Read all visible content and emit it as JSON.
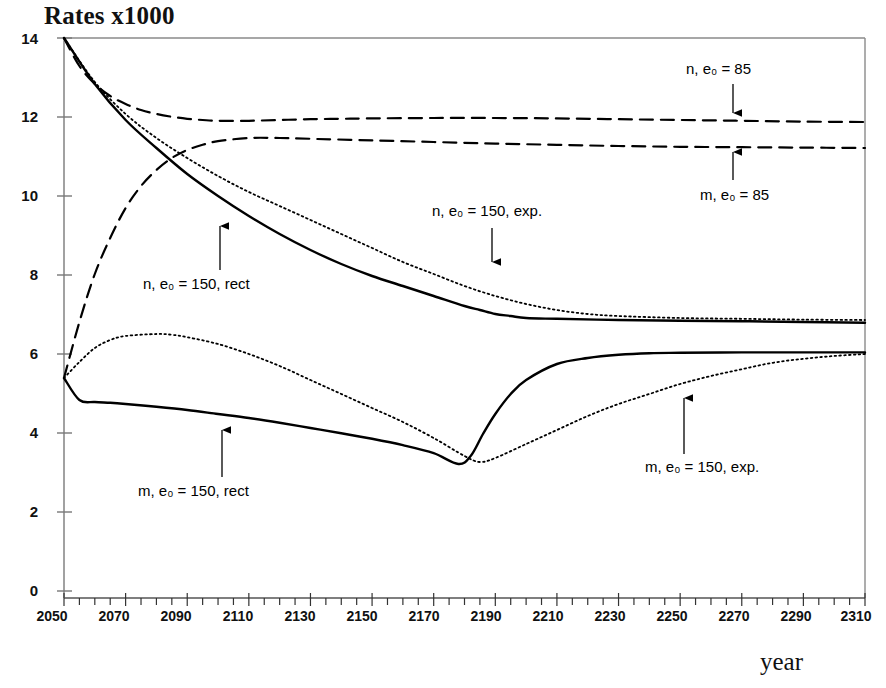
{
  "chart_data": {
    "type": "line",
    "title": "Rates x1000",
    "xlabel": "year",
    "ylabel": "Rates x1000",
    "xlim": [
      2050,
      2310
    ],
    "ylim": [
      0,
      14
    ],
    "xticks": [
      2050,
      2070,
      2090,
      2110,
      2130,
      2150,
      2170,
      2190,
      2210,
      2230,
      2250,
      2270,
      2290,
      2310
    ],
    "yticks": [
      0,
      2,
      4,
      6,
      8,
      10,
      12,
      14
    ],
    "xtick_labels": [
      "2050",
      "2070",
      "2090",
      "2110",
      "2130",
      "2150",
      "2170",
      "2190",
      "2210",
      "2230",
      "2250",
      "2270",
      "2290",
      "2310"
    ],
    "ytick_labels": [
      "0",
      "2",
      "4",
      "6",
      "8",
      "10",
      "12",
      "14"
    ],
    "minor_tick_interval": 5,
    "grid": false,
    "legend": "inline-annotations",
    "series": [
      {
        "name": "n, e0 = 85",
        "label": "n, e₀ = 85",
        "style": "dashed",
        "color": "#000000",
        "x": [
          2050,
          2055,
          2060,
          2065,
          2070,
          2075,
          2080,
          2085,
          2090,
          2095,
          2100,
          2110,
          2120,
          2130,
          2140,
          2150,
          2170,
          2190,
          2210,
          2230,
          2250,
          2270,
          2290,
          2310
        ],
        "y": [
          14.0,
          13.3,
          12.85,
          12.55,
          12.35,
          12.2,
          12.1,
          12.03,
          11.98,
          11.95,
          11.93,
          11.93,
          11.95,
          11.97,
          11.98,
          11.99,
          12.0,
          12.0,
          11.99,
          11.97,
          11.95,
          11.93,
          11.91,
          11.9
        ]
      },
      {
        "name": "m, e0 = 85",
        "label": "m, e₀ = 85",
        "style": "dashed",
        "color": "#000000",
        "x": [
          2050,
          2055,
          2060,
          2065,
          2070,
          2075,
          2080,
          2085,
          2090,
          2095,
          2100,
          2110,
          2120,
          2130,
          2150,
          2170,
          2190,
          2210,
          2230,
          2250,
          2270,
          2290,
          2310
        ],
        "y": [
          5.5,
          6.9,
          8.1,
          9.0,
          9.75,
          10.3,
          10.7,
          11.0,
          11.2,
          11.33,
          11.42,
          11.5,
          11.5,
          11.48,
          11.44,
          11.4,
          11.36,
          11.33,
          11.3,
          11.28,
          11.27,
          11.26,
          11.25
        ]
      },
      {
        "name": "n, e0 = 150, rect",
        "label": "n, e₀ = 150, rect",
        "style": "solid",
        "color": "#000000",
        "x": [
          2050,
          2060,
          2070,
          2080,
          2090,
          2100,
          2110,
          2120,
          2130,
          2140,
          2150,
          2160,
          2170,
          2180,
          2185,
          2190,
          2195,
          2200,
          2210,
          2230,
          2250,
          2270,
          2290,
          2310
        ],
        "y": [
          14.0,
          12.85,
          11.95,
          11.25,
          10.6,
          10.05,
          9.55,
          9.1,
          8.7,
          8.35,
          8.05,
          7.8,
          7.55,
          7.3,
          7.2,
          7.1,
          7.05,
          7.0,
          6.98,
          6.95,
          6.93,
          6.92,
          6.9,
          6.88
        ]
      },
      {
        "name": "m, e0 = 150, rect",
        "label": "m, e₀ = 150, rect",
        "style": "solid",
        "color": "#000000",
        "x": [
          2050,
          2055,
          2060,
          2065,
          2070,
          2080,
          2090,
          2100,
          2110,
          2120,
          2130,
          2140,
          2150,
          2160,
          2170,
          2178,
          2182,
          2186,
          2190,
          2195,
          2200,
          2210,
          2220,
          2230,
          2240,
          2250,
          2270,
          2290,
          2310
        ],
        "y": [
          5.5,
          4.95,
          4.9,
          4.88,
          4.85,
          4.78,
          4.7,
          4.6,
          4.5,
          4.38,
          4.25,
          4.12,
          3.98,
          3.82,
          3.62,
          3.35,
          3.55,
          4.1,
          4.6,
          5.1,
          5.45,
          5.85,
          6.0,
          6.08,
          6.12,
          6.13,
          6.14,
          6.14,
          6.14
        ]
      },
      {
        "name": "n, e0 = 150, exp.",
        "label": "n, e₀ = 150, exp.",
        "style": "dotted",
        "color": "#000000",
        "x": [
          2050,
          2060,
          2070,
          2080,
          2090,
          2100,
          2110,
          2120,
          2130,
          2140,
          2150,
          2160,
          2170,
          2180,
          2190,
          2200,
          2210,
          2220,
          2230,
          2250,
          2270,
          2290,
          2310
        ],
        "y": [
          14.0,
          12.9,
          12.1,
          11.5,
          11.0,
          10.55,
          10.15,
          9.8,
          9.45,
          9.1,
          8.75,
          8.4,
          8.1,
          7.8,
          7.55,
          7.35,
          7.2,
          7.1,
          7.05,
          7.0,
          6.98,
          6.96,
          6.95
        ]
      },
      {
        "name": "m, e0 = 150, exp.",
        "label": "m, e₀ = 150, exp.",
        "style": "dotted",
        "color": "#000000",
        "x": [
          2050,
          2055,
          2060,
          2065,
          2070,
          2080,
          2085,
          2090,
          2100,
          2110,
          2120,
          2130,
          2140,
          2150,
          2160,
          2170,
          2180,
          2185,
          2190,
          2200,
          2210,
          2220,
          2230,
          2240,
          2250,
          2260,
          2270,
          2280,
          2290,
          2300,
          2310
        ],
        "y": [
          5.5,
          5.9,
          6.25,
          6.45,
          6.55,
          6.6,
          6.58,
          6.52,
          6.35,
          6.1,
          5.8,
          5.45,
          5.1,
          4.75,
          4.4,
          4.0,
          3.55,
          3.4,
          3.5,
          3.85,
          4.2,
          4.55,
          4.85,
          5.1,
          5.35,
          5.55,
          5.72,
          5.88,
          5.98,
          6.05,
          6.1
        ]
      }
    ],
    "annotations": [
      {
        "id": "n-e0-85",
        "text": "n, e₀ = 85",
        "arrow": "down"
      },
      {
        "id": "m-e0-85",
        "text": "m, e₀ = 85",
        "arrow": "up"
      },
      {
        "id": "n-150-exp",
        "text": "n, e₀ = 150, exp.",
        "arrow": "down"
      },
      {
        "id": "n-150-rect",
        "text": "n, e₀ = 150, rect",
        "arrow": "up"
      },
      {
        "id": "m-150-rect",
        "text": "m, e₀ = 150, rect",
        "arrow": "up"
      },
      {
        "id": "m-150-exp",
        "text": "m, e₀ = 150, exp.",
        "arrow": "up"
      }
    ]
  },
  "axis": {
    "title": "Rates x1000",
    "xlabel": "year"
  },
  "colors": {
    "ink": "#000000",
    "frame": "#6f6f6f",
    "background": "#ffffff"
  }
}
